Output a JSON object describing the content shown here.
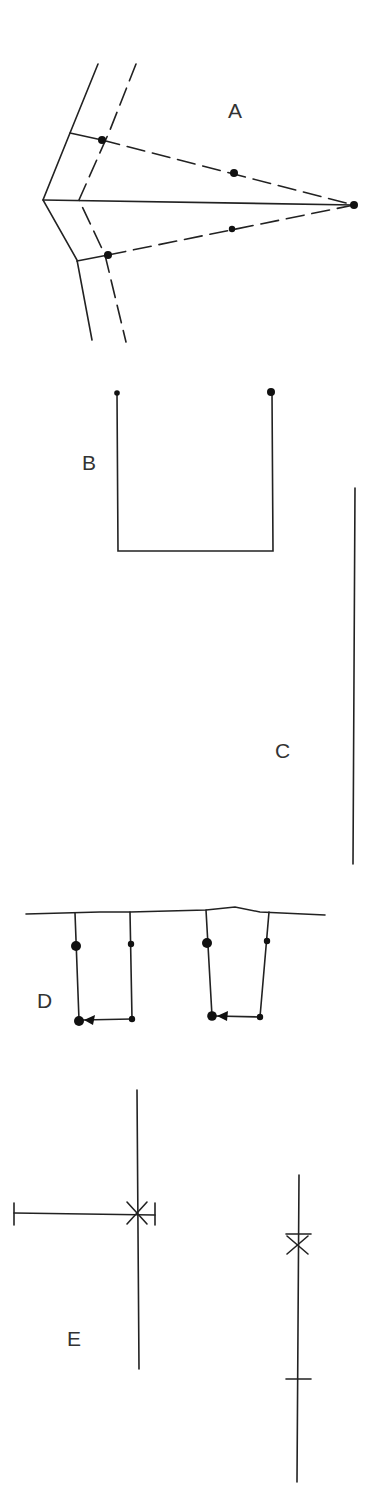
{
  "figure": {
    "panels": [
      {
        "id": "A",
        "label": "A",
        "label_pos": [
          236,
          111
        ]
      },
      {
        "id": "B",
        "label": "B",
        "label_pos": [
          90,
          469
        ]
      },
      {
        "id": "C",
        "label": "C",
        "label_pos": [
          283,
          750
        ]
      },
      {
        "id": "D",
        "label": "D",
        "label_pos": [
          42,
          1000
        ]
      },
      {
        "id": "E",
        "label": "E",
        "label_pos": [
          74,
          1337
        ]
      }
    ],
    "colors": {
      "stroke": "#222222",
      "text": "#333333",
      "background": "#ffffff"
    }
  }
}
